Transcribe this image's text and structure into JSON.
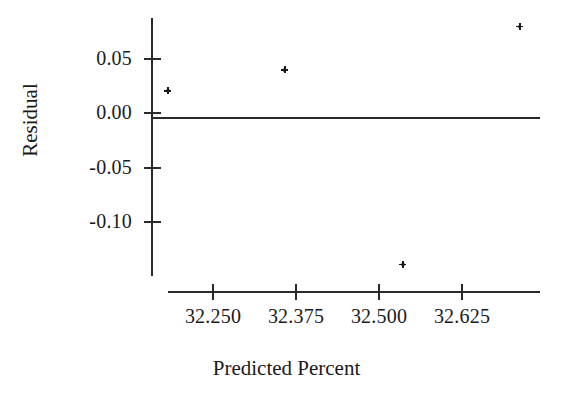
{
  "chart_data": {
    "type": "scatter",
    "title": "",
    "xlabel": "Predicted Percent",
    "ylabel": "Residual",
    "xlim": [
      32.17,
      32.73
    ],
    "ylim": [
      -0.155,
      0.092
    ],
    "grid": false,
    "legend": null,
    "xticks": [
      32.25,
      32.375,
      32.5,
      32.625
    ],
    "xtick_labels": [
      "32.250",
      "32.375",
      "32.500",
      "32.625"
    ],
    "yticks": [
      0.05,
      0.0,
      -0.05,
      -0.1
    ],
    "ytick_labels": [
      "0.05",
      "0.00",
      "-0.05",
      "-0.10"
    ],
    "reference_line": {
      "orientation": "horizontal",
      "y": 0.0
    },
    "series": [
      {
        "name": "Residuals",
        "marker": "plus",
        "color": "#1a1a1a",
        "points": [
          {
            "x": 32.182,
            "y": 0.021
          },
          {
            "x": 32.358,
            "y": 0.04
          },
          {
            "x": 32.536,
            "y": -0.139
          },
          {
            "x": 32.712,
            "y": 0.08
          }
        ]
      }
    ]
  },
  "colors": {
    "axis": "#2a2a2a",
    "marker": "#1a1a1a",
    "background": "#ffffff"
  }
}
